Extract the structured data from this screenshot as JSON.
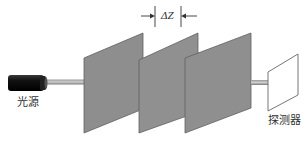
{
  "diagram": {
    "type": "optical-setup",
    "components": {
      "light_source": {
        "label": "光源",
        "color": "#1a1a1a"
      },
      "plates": [
        {
          "id": 1,
          "color": "#8e8e8e"
        },
        {
          "id": 2,
          "color": "#8e8e8e"
        },
        {
          "id": 3,
          "color": "#8e8e8e"
        }
      ],
      "detector": {
        "label": "探测器",
        "color": "#ffffff"
      }
    },
    "spacing": {
      "label": "ΔZ"
    },
    "beam_color": "#777777"
  }
}
